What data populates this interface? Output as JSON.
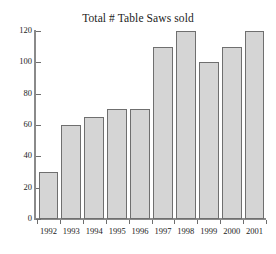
{
  "chart_data": {
    "type": "bar",
    "title": "Total # Table Saws sold",
    "xlabel": "",
    "ylabel": "",
    "categories": [
      "1992",
      "1993",
      "1994",
      "1995",
      "1996",
      "1997",
      "1998",
      "1999",
      "2000",
      "2001"
    ],
    "values": [
      30,
      60,
      65,
      70,
      70,
      110,
      120,
      100,
      110,
      120
    ],
    "ylim": [
      0,
      120
    ],
    "yticks": [
      0,
      20,
      40,
      60,
      80,
      100,
      120
    ],
    "ytick_labels": [
      "0",
      "20",
      "40",
      "60",
      "80",
      "100",
      "120"
    ],
    "grid": false,
    "legend": "none",
    "bar_fill_color": "#d5d5d5",
    "bar_edge_color": "#6f6f6f",
    "axis_color": "#8a8a8a",
    "background_color": "#ffffff"
  }
}
